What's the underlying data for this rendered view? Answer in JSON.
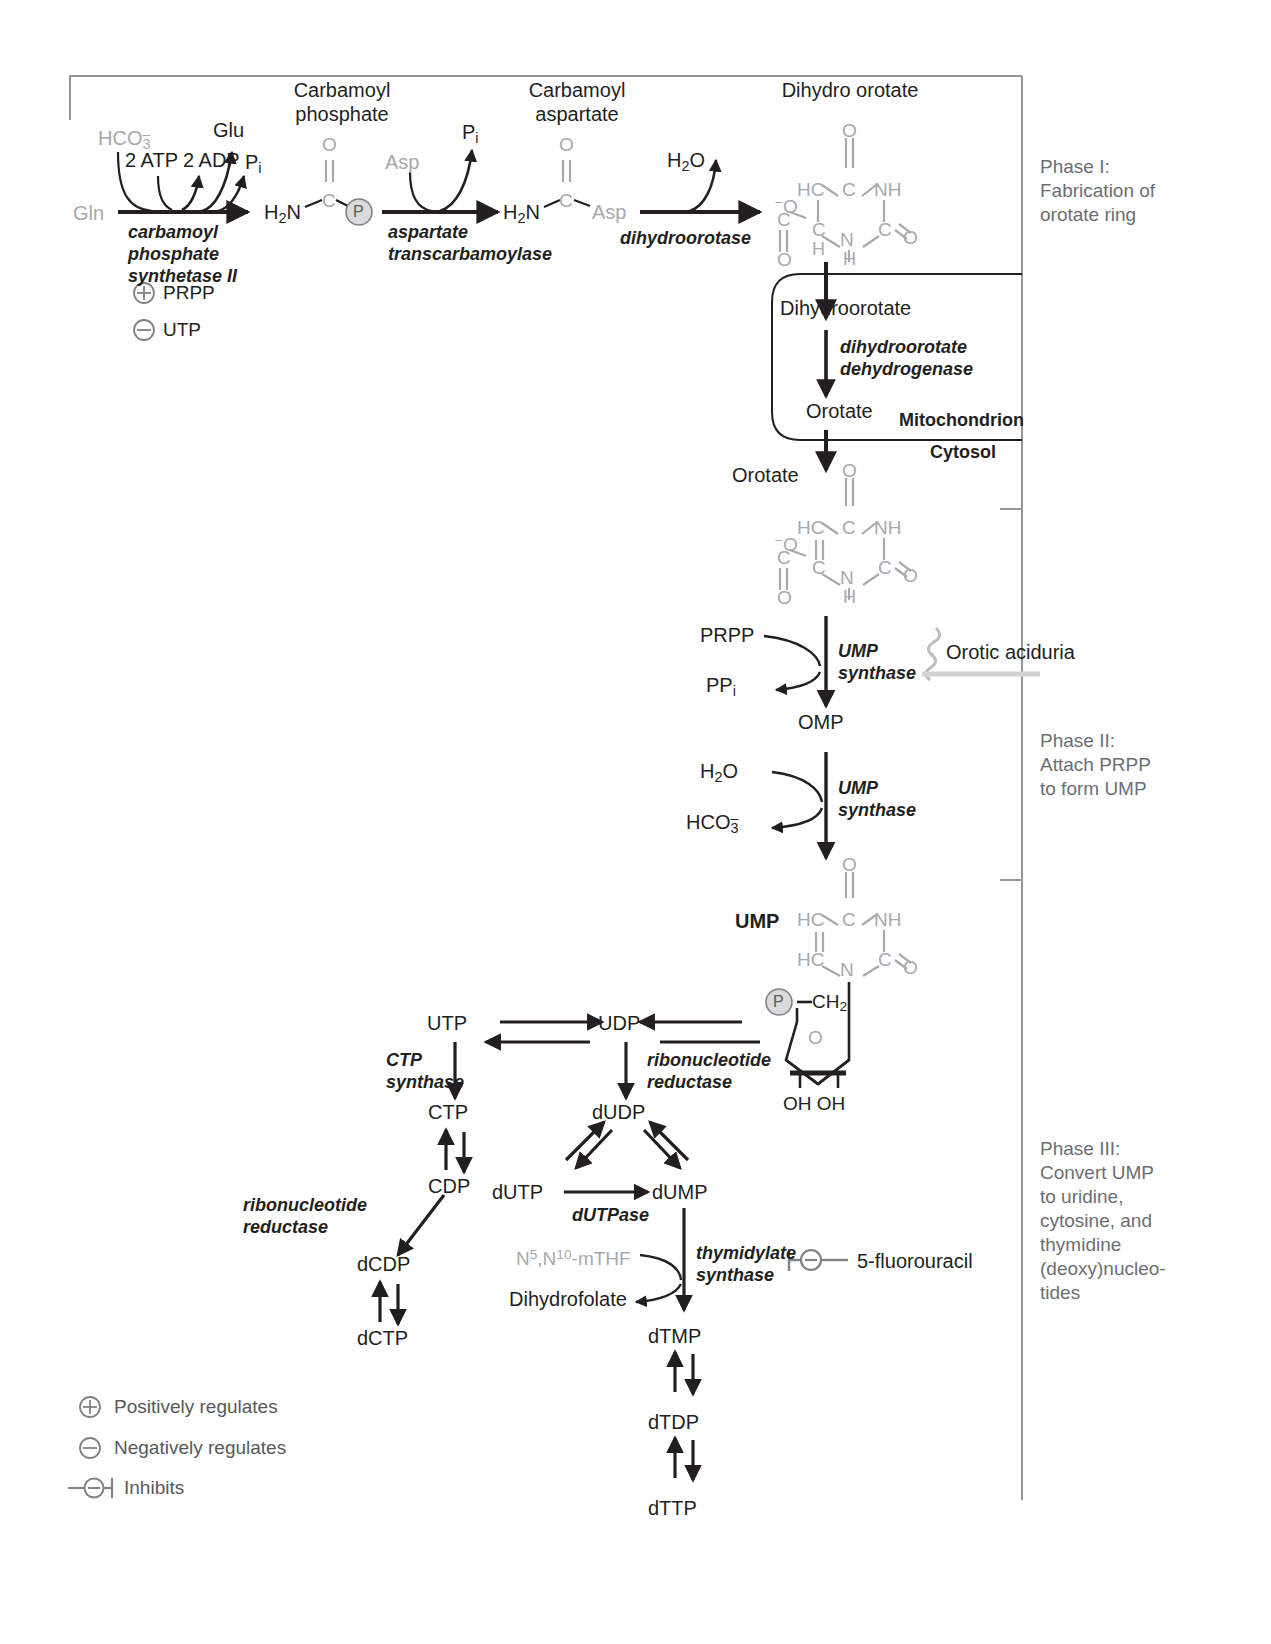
{
  "frame": {
    "present": true
  },
  "phases": [
    {
      "id": "phase-1",
      "text": "Phase I:\nFabrication of\norotate ring"
    },
    {
      "id": "phase-2",
      "text": "Phase II:\nAttach PRPP\nto form UMP"
    },
    {
      "id": "phase-3",
      "text": "Phase III:\nConvert UMP\nto uridine,\ncytosine, and\nthymidine\n(deoxy)nucleo-\ntides"
    }
  ],
  "compound_titles": {
    "carbamoyl_phosphate": "Carbamoyl\nphosphate",
    "carbamoyl_aspartate": "Carbamoyl\naspartate",
    "dihydro_orotate": "Dihydro orotate"
  },
  "step1": {
    "substrate": "Gln",
    "cofactor_in_1": "HCO3",
    "cofactor_in_1_charge": "−",
    "cofactor_in_2": "2 ATP",
    "product_out_1": "Glu",
    "product_out_2": "2 ADP",
    "product_out_3": "Pi",
    "enzyme": "carbamoyl\nphosphate\nsynthetase II",
    "regulators": [
      {
        "sign": "plus",
        "label": "PRPP"
      },
      {
        "sign": "minus",
        "label": "UTP"
      }
    ]
  },
  "step2": {
    "substrate_in": "Asp",
    "product_out": "Pi",
    "enzyme": "aspartate\ntranscarbamoylase",
    "structure": {
      "left": "H2N",
      "center_atom": "C",
      "top": "O",
      "right": "P"
    }
  },
  "step3": {
    "product_out": "H2O",
    "enzyme": "dihydroorotase",
    "structure": {
      "left": "H2N",
      "center_atom": "C",
      "top": "O",
      "right": "Asp"
    }
  },
  "mitochondrion": {
    "inner_label": "Mitochondrion",
    "outer_label": "Cytosol",
    "top_metabolite": "Dihydroorotate",
    "enzyme": "dihydroorotate\ndehydrogenase",
    "bottom_metabolite": "Orotate"
  },
  "cytosol": {
    "orotate_label": "Orotate"
  },
  "ump_synthase_step_1": {
    "substrate_in": "PRPP",
    "product_out": "PPi",
    "enzyme": "UMP\nsynthase",
    "product": "OMP",
    "disease": "Orotic aciduria"
  },
  "ump_synthase_step_2": {
    "substrate_in": "H2O",
    "product_out": "HCO3",
    "enzyme": "UMP\nsynthase",
    "product": "UMP"
  },
  "ump_structure": {
    "label": "UMP",
    "ring_atoms": [
      "O",
      "C",
      "HC",
      "NH",
      "HC",
      "C",
      "N",
      "O"
    ],
    "phosphate": "P",
    "ch2": "CH2",
    "ring_o": "O",
    "hydroxyls": "OH OH"
  },
  "orotate_structure": {
    "ring_atoms": [
      "O",
      "C",
      "HC",
      "NH",
      "C",
      "C",
      "N",
      "H",
      "O"
    ],
    "carboxyl_left": "O",
    "carboxyl_charge": "−",
    "carboxyl_c": "C",
    "carboxyl_o": "O"
  },
  "dihydro_orotate_structure": {
    "ring_atoms": [
      "O",
      "C",
      "HC",
      "NH",
      "C",
      "C",
      "H",
      "N",
      "H",
      "O"
    ],
    "carboxyl_left": "O",
    "carboxyl_charge": "−",
    "carboxyl_c": "C",
    "carboxyl_o": "O"
  },
  "phase3_nodes": {
    "utp": "UTP",
    "udp": "UDP",
    "ctp": "CTP",
    "cdp": "CDP",
    "dcdp": "dCDP",
    "dctp": "dCTP",
    "dudp": "dUDP",
    "dutp": "dUTP",
    "dump": "dUMP",
    "dtmp": "dTMP",
    "dtdp": "dTDP",
    "dttp": "dTTP",
    "dihydrofolate": "Dihydrofolate",
    "mthf": "N5,N10-mTHF",
    "mthf_sup1": "5",
    "mthf_sup2": "10",
    "drug": "5-fluorouracil"
  },
  "phase3_enzymes": {
    "ctp_synthase": "CTP\nsynthase",
    "ribonucleotide_reductase_right": "ribonucleotide\nreductase",
    "ribonucleotide_reductase_left": "ribonucleotide\nreductase",
    "dutpase": "dUTPase",
    "thymidylate_synthase": "thymidylate\nsynthase"
  },
  "legend": [
    {
      "icon": "plus-circle-icon",
      "label": "Positively regulates"
    },
    {
      "icon": "minus-circle-icon",
      "label": "Negatively regulates"
    },
    {
      "icon": "inhibit-icon",
      "label": "Inhibits"
    }
  ],
  "colors": {
    "ink": "#231f20",
    "gray": "#a7a9ac",
    "midgray": "#808285",
    "phase_text": "#6d6e71",
    "frame": "#939598"
  }
}
